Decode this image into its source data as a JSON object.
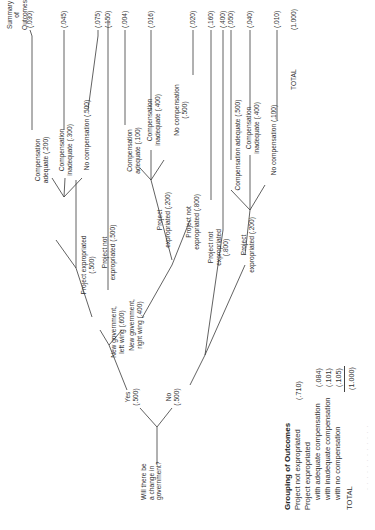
{
  "diagram": {
    "orientation": "rotated 90 degrees counter-clockwise",
    "root_question": "Will there be a change in government?",
    "summary_header": "Summary of Outcomes",
    "branches": {
      "yes": "Yes\n(.500)",
      "no": "No\n(.500)",
      "left_wing": "New government,\nleft wing (.600)",
      "right_wing": "New government,\nright wing (.400)",
      "lw_expropriated": "Project expropriated\n(.500)",
      "lw_not_expropriated": "Project not\nexpropriated (.500)",
      "lw_comp_adequate": "Compensation\nadequate (.200)",
      "lw_comp_inadequate": "Compensation\ninadequate (.300)",
      "lw_no_comp": "No compensation (.500)",
      "rw_expropriated": "Project\nexpropriated (.200)",
      "rw_not_expropriated": "Project not\nexpropriated (.800)",
      "rw_comp_adequate": "Compensation\nadequate (.100)",
      "rw_comp_inadequate": "Compensation\ninadequate (.400)",
      "rw_no_comp": "No compensation\n(.500)",
      "no_expropriated": "Project\nexpropriated (.200)",
      "no_not_expropriated": "Project not\nexpropriated (.800)",
      "no_comp_adequate": "Compensation adequate (.500)",
      "no_comp_inadequate": "Compensation\ninadequate (.400)",
      "no_no_comp": "No compensation (.100)"
    },
    "outcomes": [
      {
        "id": "lw_exp_adequate",
        "value": "(.030)"
      },
      {
        "id": "lw_exp_inadequate",
        "value": "(.045)"
      },
      {
        "id": "lw_exp_none",
        "value": "(.075)"
      },
      {
        "id": "lw_not_exp",
        "value": "(.150)"
      },
      {
        "id": "rw_exp_adequate",
        "value": "(.004)"
      },
      {
        "id": "rw_exp_inadequate",
        "value": "(.016)"
      },
      {
        "id": "rw_exp_none",
        "value": "(.020)"
      },
      {
        "id": "rw_not_exp",
        "value": "(.160)"
      },
      {
        "id": "no_not_exp",
        "value": "(.400)"
      },
      {
        "id": "no_exp_adequate",
        "value": "(.050)"
      },
      {
        "id": "no_exp_inadequate",
        "value": "(.040)"
      },
      {
        "id": "no_exp_none",
        "value": "(.010)"
      }
    ],
    "total_label": "TOTAL",
    "total_value": "(1.000)"
  },
  "grouping": {
    "title": "Grouping of Outcomes",
    "rows": [
      {
        "label": "Project not expropriated",
        "value": "(.710)"
      },
      {
        "label": "Project expropriated",
        "value": ""
      },
      {
        "label": "with adequate compensation",
        "value": "(.084)"
      },
      {
        "label": "with inadequate compensation",
        "value": "(.101)"
      },
      {
        "label": "with no compensation",
        "value": "(.105)"
      }
    ],
    "total_label": "TOTAL",
    "total_value": "(1.000)"
  },
  "caption": "· · ·  · ·  · · ·  · ·  · ·"
}
